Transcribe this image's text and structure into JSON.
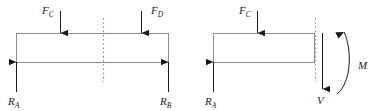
{
  "figure": {
    "type": "free-body-diagram",
    "stroke_colors": {
      "beam_outline": "#8c8c8c",
      "arrow": "#1a1a1a",
      "cut_line": "#8c8c8c",
      "text": "#1a1a1a"
    },
    "diagrams": [
      {
        "name": "full-beam-diagram",
        "beam": {
          "label": "beam-body",
          "x": 16,
          "y": 33,
          "width": 153,
          "height": 30
        },
        "cut_line": {
          "label": "section-cut-line",
          "x": 103,
          "y_top": 18,
          "y_bottom": 82,
          "style": "dotted"
        },
        "applied_loads": [
          {
            "name": "load-fc",
            "label": "F",
            "subscript": "C",
            "x": 60,
            "direction": "down",
            "tail_y": 11,
            "head_y": 33,
            "label_x": 42,
            "label_y": 14
          },
          {
            "name": "load-fd",
            "label": "F",
            "subscript": "D",
            "x": 141,
            "direction": "down",
            "tail_y": 11,
            "head_y": 33,
            "label_x": 151,
            "label_y": 14
          }
        ],
        "reactions": [
          {
            "name": "reaction-ra",
            "label": "R",
            "subscript": "A",
            "x": 16,
            "direction": "up",
            "tail_y": 92,
            "head_y": 62,
            "label_x": 8,
            "label_y": 105
          },
          {
            "name": "reaction-rb",
            "label": "R",
            "subscript": "B",
            "x": 169,
            "direction": "up",
            "tail_y": 92,
            "head_y": 62,
            "label_x": 160,
            "label_y": 105
          }
        ]
      },
      {
        "name": "cut-section-diagram",
        "beam": {
          "label": "beam-body",
          "x": 213,
          "y": 33,
          "width": 102,
          "height": 30
        },
        "cut_line": {
          "label": "section-cut-line",
          "x": 315,
          "y_top": 18,
          "y_bottom": 82,
          "style": "dotted"
        },
        "applied_loads": [
          {
            "name": "load-fc",
            "label": "F",
            "subscript": "C",
            "x": 257,
            "direction": "down",
            "tail_y": 11,
            "head_y": 33,
            "label_x": 239,
            "label_y": 14
          }
        ],
        "reactions": [
          {
            "name": "reaction-ra",
            "label": "R",
            "subscript": "A",
            "x": 213,
            "direction": "up",
            "tail_y": 92,
            "head_y": 62,
            "label_x": 205,
            "label_y": 105
          }
        ],
        "internal_forces": [
          {
            "name": "shear-force-v",
            "label": "V",
            "subscript": "",
            "x": 322,
            "direction": "down",
            "tail_y": 33,
            "head_y": 89,
            "label_x": 317,
            "label_y": 104
          },
          {
            "name": "bending-moment-m",
            "label": "M",
            "subscript": "",
            "direction": "counterclockwise",
            "label_x": 358,
            "label_y": 69
          }
        ]
      }
    ]
  }
}
